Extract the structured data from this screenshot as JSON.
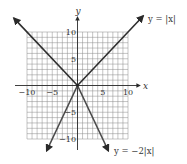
{
  "chart_data": {
    "type": "line",
    "title": "",
    "xlabel": "x",
    "ylabel": "y",
    "xlim": [
      -10,
      10
    ],
    "ylim": [
      -10,
      10
    ],
    "grid": true,
    "grid_step": 1,
    "x_ticks": [
      {
        "value": -10,
        "label": "−10"
      },
      {
        "value": -5,
        "label": "−5"
      },
      {
        "value": 5,
        "label": "5"
      },
      {
        "value": 10,
        "label": "10"
      }
    ],
    "y_ticks": [
      {
        "value": 10,
        "label": "10"
      },
      {
        "value": 5,
        "label": "5"
      },
      {
        "value": -5,
        "label": "−5"
      },
      {
        "value": -10,
        "label": "−10"
      }
    ],
    "series": [
      {
        "name": "y = |x|",
        "label": "y = |x|",
        "points": [
          [
            -12.6,
            12.6
          ],
          [
            0,
            0
          ],
          [
            13,
            13
          ]
        ],
        "label_position": "top-right"
      },
      {
        "name": "y = −2|x|",
        "label": "y = −2|x|",
        "points": [
          [
            -6.1,
            -12.2
          ],
          [
            0,
            0
          ],
          [
            6.1,
            -12.2
          ]
        ],
        "label_position": "bottom-right"
      }
    ]
  }
}
